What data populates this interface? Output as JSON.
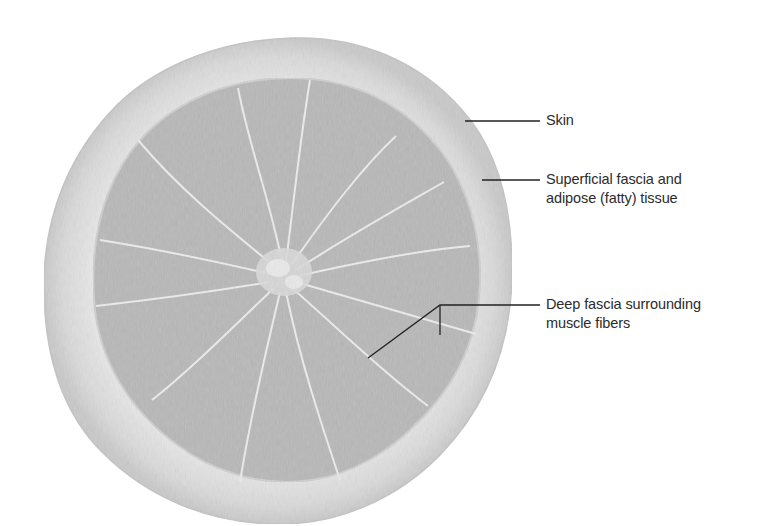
{
  "diagram": {
    "colors": {
      "background": "#ffffff",
      "rind_outer": "#cdcdcd",
      "rind_inner": "#e4e4e4",
      "segment_fill": "#b9b9b9",
      "segment_membrane": "#e9e9e9",
      "core": "#d8d8d8",
      "leader_line": "#222222",
      "label_text": "#2b2b2b"
    },
    "labels": [
      {
        "id": "skin",
        "text": "Skin"
      },
      {
        "id": "superficial-fascia",
        "line1": "Superficial fascia and",
        "line2": "adipose (fatty) tissue"
      },
      {
        "id": "deep-fascia",
        "line1": "Deep fascia surrounding",
        "line2": "muscle fibers"
      }
    ]
  }
}
